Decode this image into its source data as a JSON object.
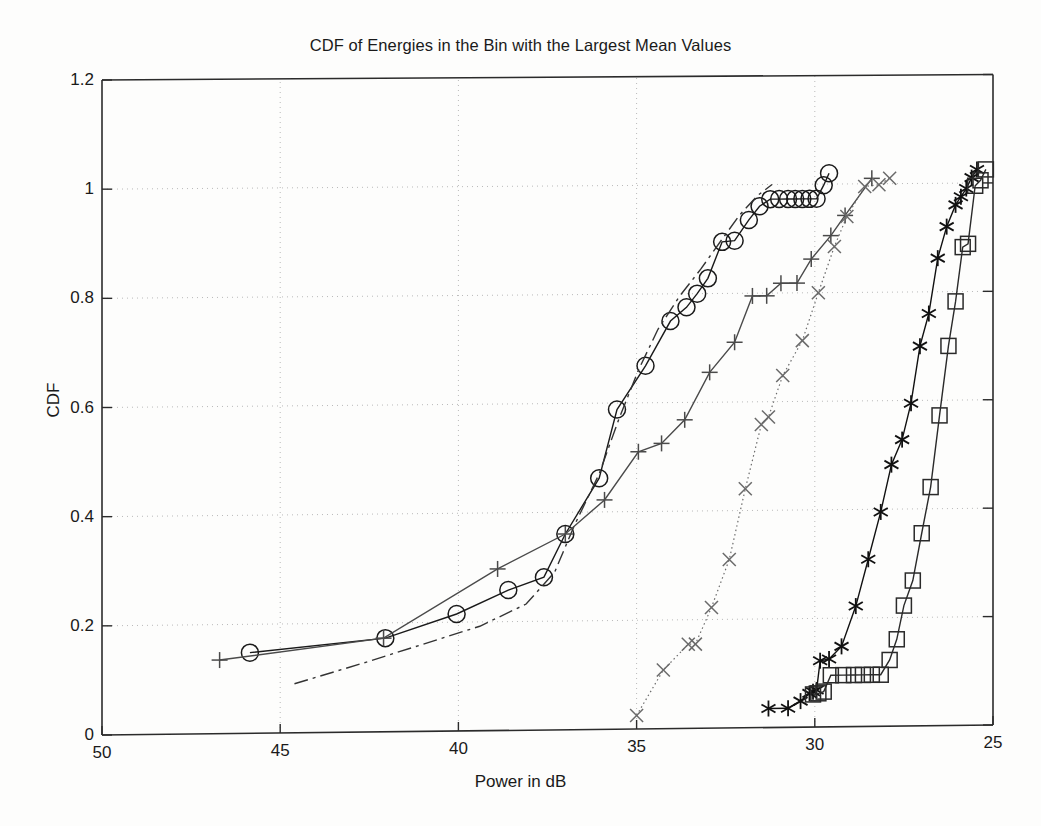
{
  "chart_data": {
    "type": "line",
    "title": "CDF of Energies in the Bin with the Largest Mean Values",
    "xlabel": "Power in dB",
    "ylabel": "CDF",
    "xlim": [
      50,
      25
    ],
    "ylim": [
      0,
      1.2
    ],
    "x_inverted": true,
    "grid": true,
    "legend": "none",
    "xticks": [
      50,
      45,
      40,
      35,
      30,
      25
    ],
    "yticks": [
      0,
      0.2,
      0.4,
      0.6,
      0.8,
      1,
      1.2
    ],
    "ytick_labels": [
      "0",
      "0.2",
      "0.4",
      "0.6",
      "0.8",
      "1",
      "1.2"
    ],
    "xtick_labels": [
      "50",
      "45",
      "40",
      "35",
      "30",
      "25"
    ],
    "series": [
      {
        "name": "circle-series",
        "marker": "circle",
        "linestyle": "solid",
        "color": "#1a1a1a",
        "points": [
          [
            45.85,
            0.148
          ],
          [
            42.05,
            0.172
          ],
          [
            40.05,
            0.215
          ],
          [
            38.6,
            0.258
          ],
          [
            37.6,
            0.281
          ],
          [
            37.0,
            0.36
          ],
          [
            36.05,
            0.462
          ],
          [
            35.55,
            0.588
          ],
          [
            34.75,
            0.668
          ],
          [
            34.05,
            0.75
          ],
          [
            33.6,
            0.775
          ],
          [
            33.3,
            0.8
          ],
          [
            33.0,
            0.828
          ],
          [
            32.6,
            0.895
          ],
          [
            32.25,
            0.897
          ],
          [
            31.85,
            0.935
          ],
          [
            31.55,
            0.96
          ],
          [
            31.25,
            0.973
          ],
          [
            31.0,
            0.973
          ],
          [
            30.75,
            0.973
          ],
          [
            30.55,
            0.973
          ],
          [
            30.35,
            0.973
          ],
          [
            30.15,
            0.973
          ],
          [
            29.95,
            0.973
          ],
          [
            29.75,
            0.998
          ],
          [
            29.6,
            1.02
          ]
        ]
      },
      {
        "name": "dashdot-series",
        "marker": "none",
        "linestyle": "dashdot",
        "color": "#333333",
        "points": [
          [
            44.6,
            0.09
          ],
          [
            42.6,
            0.128
          ],
          [
            41.0,
            0.16
          ],
          [
            39.4,
            0.192
          ],
          [
            38.1,
            0.232
          ],
          [
            37.3,
            0.29
          ],
          [
            36.75,
            0.375
          ],
          [
            36.05,
            0.47
          ],
          [
            35.5,
            0.57
          ],
          [
            34.95,
            0.66
          ],
          [
            34.4,
            0.735
          ],
          [
            33.8,
            0.795
          ],
          [
            33.2,
            0.845
          ],
          [
            32.6,
            0.9
          ],
          [
            32.1,
            0.945
          ],
          [
            31.6,
            0.98
          ],
          [
            31.2,
            1.0
          ]
        ]
      },
      {
        "name": "plus-series",
        "marker": "plus",
        "linestyle": "solid",
        "color": "#4a4a4a",
        "points": [
          [
            46.7,
            0.135
          ],
          [
            42.1,
            0.172
          ],
          [
            38.9,
            0.297
          ],
          [
            37.0,
            0.36
          ],
          [
            35.9,
            0.422
          ],
          [
            34.95,
            0.51
          ],
          [
            34.3,
            0.525
          ],
          [
            33.65,
            0.568
          ],
          [
            32.95,
            0.655
          ],
          [
            32.25,
            0.71
          ],
          [
            31.75,
            0.795
          ],
          [
            31.35,
            0.795
          ],
          [
            30.95,
            0.818
          ],
          [
            30.5,
            0.818
          ],
          [
            30.1,
            0.862
          ],
          [
            29.55,
            0.905
          ],
          [
            29.15,
            0.942
          ],
          [
            28.4,
            1.01
          ]
        ]
      },
      {
        "name": "cross-series",
        "marker": "cross",
        "linestyle": "dotted",
        "color": "#6a6a6a",
        "points": [
          [
            35.0,
            0.025
          ],
          [
            34.25,
            0.108
          ],
          [
            33.55,
            0.155
          ],
          [
            33.35,
            0.155
          ],
          [
            32.9,
            0.222
          ],
          [
            32.4,
            0.31
          ],
          [
            31.95,
            0.44
          ],
          [
            31.5,
            0.558
          ],
          [
            31.3,
            0.572
          ],
          [
            30.9,
            0.648
          ],
          [
            30.35,
            0.712
          ],
          [
            29.9,
            0.8
          ],
          [
            29.45,
            0.885
          ],
          [
            29.1,
            0.94
          ],
          [
            28.6,
            0.995
          ],
          [
            28.2,
            0.998
          ],
          [
            27.9,
            1.01
          ]
        ]
      },
      {
        "name": "asterisk-series",
        "marker": "asterisk",
        "linestyle": "solid",
        "color": "#111111",
        "points": [
          [
            31.3,
            0.035
          ],
          [
            30.75,
            0.035
          ],
          [
            30.4,
            0.048
          ],
          [
            30.15,
            0.062
          ],
          [
            30.05,
            0.065
          ],
          [
            29.95,
            0.068
          ],
          [
            29.85,
            0.122
          ],
          [
            29.6,
            0.125
          ],
          [
            29.25,
            0.148
          ],
          [
            28.85,
            0.222
          ],
          [
            28.5,
            0.308
          ],
          [
            28.15,
            0.395
          ],
          [
            27.85,
            0.482
          ],
          [
            27.55,
            0.528
          ],
          [
            27.3,
            0.595
          ],
          [
            27.05,
            0.7
          ],
          [
            26.8,
            0.76
          ],
          [
            26.55,
            0.862
          ],
          [
            26.3,
            0.92
          ],
          [
            26.05,
            0.96
          ],
          [
            25.9,
            0.975
          ],
          [
            25.75,
            0.99
          ],
          [
            25.6,
            1.01
          ],
          [
            25.45,
            1.025
          ]
        ]
      },
      {
        "name": "square-series",
        "marker": "square",
        "linestyle": "solid",
        "color": "#2a2a2a",
        "points": [
          [
            30.05,
            0.06
          ],
          [
            29.9,
            0.062
          ],
          [
            29.75,
            0.065
          ],
          [
            29.55,
            0.095
          ],
          [
            29.2,
            0.095
          ],
          [
            28.9,
            0.095
          ],
          [
            28.65,
            0.095
          ],
          [
            28.4,
            0.095
          ],
          [
            28.15,
            0.095
          ],
          [
            27.9,
            0.122
          ],
          [
            27.7,
            0.16
          ],
          [
            27.5,
            0.222
          ],
          [
            27.25,
            0.268
          ],
          [
            27.0,
            0.355
          ],
          [
            26.75,
            0.44
          ],
          [
            26.5,
            0.572
          ],
          [
            26.25,
            0.7
          ],
          [
            26.05,
            0.782
          ],
          [
            25.85,
            0.882
          ],
          [
            25.7,
            0.888
          ],
          [
            25.5,
            0.995
          ],
          [
            25.35,
            1.005
          ],
          [
            25.2,
            1.025
          ]
        ]
      }
    ]
  }
}
